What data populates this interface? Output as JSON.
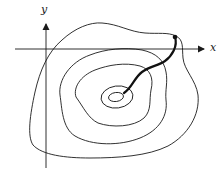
{
  "diagram": {
    "type": "contour-plot-with-path",
    "axes": {
      "x_label": "x",
      "y_label": "y"
    },
    "contours": {
      "count": 5,
      "description": "nested closed level curves around a central minimum"
    },
    "path": {
      "description": "thick curve from a marked point on the outer contour to the center",
      "start_marker": "filled dot"
    },
    "colors": {
      "ink": "#1a1a1a",
      "background": "#ffffff"
    }
  }
}
